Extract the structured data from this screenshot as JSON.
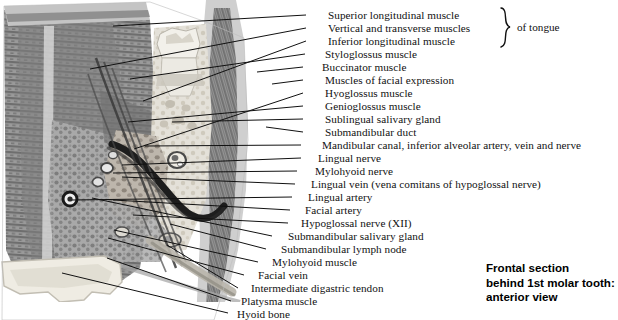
{
  "figure": {
    "caption_lines": [
      "Frontal section",
      "behind 1st molar tooth:",
      "anterior view"
    ],
    "group_brace_label": "of tongue",
    "illustration_alt": "grayscale-histological-frontal-section-of-floor-of-mouth"
  },
  "labels": [
    {
      "id": "superior-longitudinal-muscle",
      "text": "Superior longitudinal muscle",
      "text_x": 328,
      "text_y": 9,
      "line_x1": 306,
      "line_y1": 15,
      "line_x2": 113,
      "line_y2": 26
    },
    {
      "id": "vertical-and-transverse-muscles",
      "text": "Vertical and transverse muscles",
      "text_x": 328,
      "text_y": 22,
      "line_x1": 306,
      "line_y1": 28,
      "line_x2": 90,
      "line_y2": 69
    },
    {
      "id": "inferior-longitudinal-muscle",
      "text": "Inferior longitudinal muscle",
      "text_x": 328,
      "text_y": 35,
      "line_x1": 306,
      "line_y1": 41,
      "line_x2": 143,
      "line_y2": 101
    },
    {
      "id": "styloglossus-muscle",
      "text": "Styloglossus muscle",
      "text_x": 325,
      "text_y": 48,
      "line_x1": 305,
      "line_y1": 54,
      "line_x2": 130,
      "line_y2": 79
    },
    {
      "id": "buccinator-muscle",
      "text": "Buccinator muscle",
      "text_x": 322,
      "text_y": 61,
      "line_x1": 303,
      "line_y1": 67,
      "line_x2": 257,
      "line_y2": 72
    },
    {
      "id": "muscles-of-facial-expression",
      "text": "Muscles of facial expression",
      "text_x": 325,
      "text_y": 74,
      "line_x1": 303,
      "line_y1": 80,
      "line_x2": 272,
      "line_y2": 84
    },
    {
      "id": "hyoglossus-muscle",
      "text": "Hyoglossus muscle",
      "text_x": 325,
      "text_y": 87,
      "line_x1": 303,
      "line_y1": 93,
      "line_x2": 134,
      "line_y2": 149
    },
    {
      "id": "genioglossus-muscle",
      "text": "Genioglossus muscle",
      "text_x": 325,
      "text_y": 100,
      "line_x1": 303,
      "line_y1": 106,
      "line_x2": 128,
      "line_y2": 122
    },
    {
      "id": "sublingual-salivary-gland",
      "text": "Sublingual salivary gland",
      "text_x": 325,
      "text_y": 113,
      "line_x1": 303,
      "line_y1": 119,
      "line_x2": 172,
      "line_y2": 122
    },
    {
      "id": "submandibular-duct",
      "text": "Submandibular duct",
      "text_x": 325,
      "text_y": 126,
      "line_x1": 303,
      "line_y1": 132,
      "line_x2": 266,
      "line_y2": 127
    },
    {
      "id": "mandibular-canal",
      "text": "Mandibular canal, inferior alveolar artery, vein and nerve",
      "text_x": 322,
      "text_y": 139,
      "line_x1": 301,
      "line_y1": 145,
      "line_x2": 145,
      "line_y2": 146
    },
    {
      "id": "lingual-nerve",
      "text": "Lingual nerve",
      "text_x": 318,
      "text_y": 152,
      "line_x1": 301,
      "line_y1": 158,
      "line_x2": 122,
      "line_y2": 165
    },
    {
      "id": "mylohyoid-nerve",
      "text": "Mylohyoid nerve",
      "text_x": 315,
      "text_y": 165,
      "line_x1": 297,
      "line_y1": 171,
      "line_x2": 113,
      "line_y2": 173
    },
    {
      "id": "lingual-vein",
      "text": "Lingual vein (vena comitans of hypoglossal nerve)",
      "text_x": 311,
      "text_y": 178,
      "line_x1": 295,
      "line_y1": 184,
      "line_x2": 122,
      "line_y2": 177
    },
    {
      "id": "lingual-artery",
      "text": "Lingual artery",
      "text_x": 308,
      "text_y": 191,
      "line_x1": 292,
      "line_y1": 197,
      "line_x2": 72,
      "line_y2": 200
    },
    {
      "id": "facial-artery",
      "text": "Facial artery",
      "text_x": 305,
      "text_y": 204,
      "line_x1": 290,
      "line_y1": 210,
      "line_x2": 113,
      "line_y2": 200
    },
    {
      "id": "hypoglossal-nerve-xii",
      "text": "Hypoglossal nerve (XII)",
      "text_x": 301,
      "text_y": 217,
      "line_x1": 288,
      "line_y1": 223,
      "line_x2": 133,
      "line_y2": 215
    },
    {
      "id": "submandibular-salivary-gland",
      "text": "Submandibular salivary gland",
      "text_x": 288,
      "text_y": 230,
      "line_x1": 272,
      "line_y1": 236,
      "line_x2": 92,
      "line_y2": 198
    },
    {
      "id": "submandibular-lymph-node",
      "text": "Submandibular lymph node",
      "text_x": 281,
      "text_y": 243,
      "line_x1": 266,
      "line_y1": 249,
      "line_x2": 170,
      "line_y2": 224
    },
    {
      "id": "mylohyoid-muscle",
      "text": "Mylohyoid muscle",
      "text_x": 272,
      "text_y": 256,
      "line_x1": 258,
      "line_y1": 262,
      "line_x2": 114,
      "line_y2": 230
    },
    {
      "id": "facial-vein",
      "text": "Facial vein",
      "text_x": 258,
      "text_y": 269,
      "line_x1": 244,
      "line_y1": 275,
      "line_x2": 108,
      "line_y2": 238
    },
    {
      "id": "intermediate-digastric-tendon",
      "text": "Intermediate digastric tendon",
      "text_x": 251,
      "text_y": 282,
      "line_x1": 238,
      "line_y1": 288,
      "line_x2": 167,
      "line_y2": 245
    },
    {
      "id": "platysma-muscle",
      "text": "Platysma muscle",
      "text_x": 241,
      "text_y": 295,
      "line_x1": 231,
      "line_y1": 301,
      "line_x2": 107,
      "line_y2": 258
    },
    {
      "id": "hyoid-bone",
      "text": "Hyoid bone",
      "text_x": 237,
      "text_y": 308,
      "line_x1": 228,
      "line_y1": 313,
      "line_x2": 62,
      "line_y2": 273
    }
  ],
  "style": {
    "leader_color": "#111111",
    "text_color": "#111111",
    "caption_color": "#000000",
    "background": "#ffffff"
  }
}
